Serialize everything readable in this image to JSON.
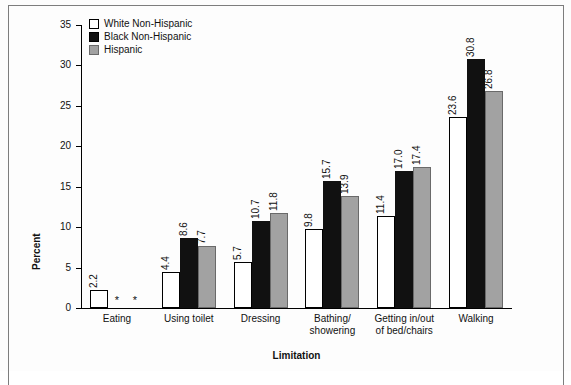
{
  "chart_data": {
    "type": "bar",
    "title": "",
    "xlabel": "Limitation",
    "ylabel": "Percent",
    "ylim": [
      0,
      35
    ],
    "yticks": [
      0,
      5,
      10,
      15,
      20,
      25,
      30,
      35
    ],
    "grid": false,
    "legend_position": "top-left",
    "categories": [
      "Eating",
      "Using toilet",
      "Dressing",
      "Bathing/\nshowering",
      "Getting in/out\nof bed/chairs",
      "Walking"
    ],
    "series": [
      {
        "name": "White Non-Hispanic",
        "color": "#ffffff",
        "values": [
          2.2,
          4.4,
          5.7,
          9.8,
          11.4,
          23.6
        ],
        "labels": [
          "2.2",
          "4.4",
          "5.7",
          "9.8",
          "11.4",
          "23.6"
        ]
      },
      {
        "name": "Black Non-Hispanic",
        "color": "#111111",
        "values": [
          null,
          8.6,
          10.7,
          15.7,
          17.0,
          30.8
        ],
        "labels": [
          "*",
          "8.6",
          "10.7",
          "15.7",
          "17.0",
          "30.8"
        ]
      },
      {
        "name": "Hispanic",
        "color": "#a2a2a2",
        "values": [
          null,
          7.7,
          11.8,
          13.9,
          17.4,
          26.8
        ],
        "labels": [
          "*",
          "7.7",
          "11.8",
          "13.9",
          "17.4",
          "26.8"
        ]
      }
    ],
    "suppressed_marker": "*"
  }
}
